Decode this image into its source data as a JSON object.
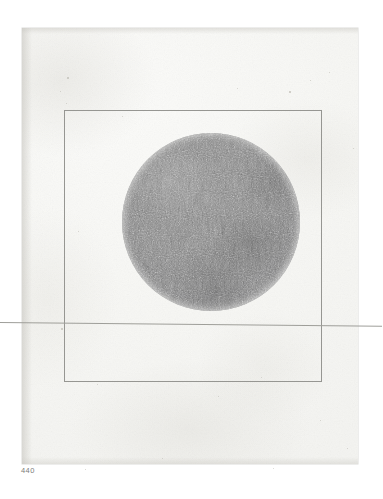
{
  "page": {
    "folio": "440",
    "background_color": "#ffffff"
  },
  "paper": {
    "tone_color": "#f7f7f4",
    "edge_shadow_color": "#c4c2bc",
    "specks": [
      {
        "x": 45,
        "y": 49,
        "size": 2.0,
        "name": "paper-speck"
      },
      {
        "x": 38,
        "y": 63,
        "size": 1.4,
        "name": "paper-speck"
      },
      {
        "x": 44,
        "y": 75,
        "size": 1.2,
        "name": "paper-speck"
      },
      {
        "x": 288,
        "y": 52,
        "size": 1.4,
        "name": "paper-speck"
      },
      {
        "x": 307,
        "y": 44,
        "size": 1.1,
        "name": "paper-speck"
      },
      {
        "x": 267,
        "y": 63,
        "size": 1.6,
        "name": "paper-speck"
      },
      {
        "x": 215,
        "y": 60,
        "size": 1.0,
        "name": "paper-speck"
      },
      {
        "x": 100,
        "y": 88,
        "size": 1.1,
        "name": "paper-speck"
      },
      {
        "x": 331,
        "y": 120,
        "size": 1.3,
        "name": "paper-speck"
      },
      {
        "x": 56,
        "y": 203,
        "size": 1.2,
        "name": "paper-speck"
      },
      {
        "x": 39,
        "y": 300,
        "size": 1.5,
        "name": "paper-speck"
      },
      {
        "x": 75,
        "y": 356,
        "size": 1.1,
        "name": "paper-speck"
      },
      {
        "x": 196,
        "y": 368,
        "size": 1.3,
        "name": "paper-speck"
      },
      {
        "x": 239,
        "y": 349,
        "size": 1.0,
        "name": "paper-speck"
      },
      {
        "x": 298,
        "y": 392,
        "size": 1.4,
        "name": "paper-speck"
      },
      {
        "x": 325,
        "y": 420,
        "size": 1.2,
        "name": "paper-speck"
      },
      {
        "x": 140,
        "y": 430,
        "size": 1.1,
        "name": "paper-speck"
      },
      {
        "x": 63,
        "y": 441,
        "size": 1.3,
        "name": "paper-speck"
      },
      {
        "x": 251,
        "y": 440,
        "size": 1.0,
        "name": "paper-speck"
      },
      {
        "x": 180,
        "y": 140,
        "size": 0.9,
        "name": "paper-speck"
      }
    ]
  },
  "artwork": {
    "title": "graphite disc drawing",
    "ruled_square": {
      "line_color": "#969692",
      "left": 42,
      "top": 82,
      "width": 258,
      "height": 272
    },
    "crease_line": {
      "line_color": "#9e9e99",
      "top": 294,
      "angle_deg": 0.55
    },
    "disc": {
      "shape": "circle",
      "graphite_color": "#868686",
      "rim_color": "#f8f8f6",
      "left": 100,
      "top": 105,
      "diameter": 178
    }
  }
}
